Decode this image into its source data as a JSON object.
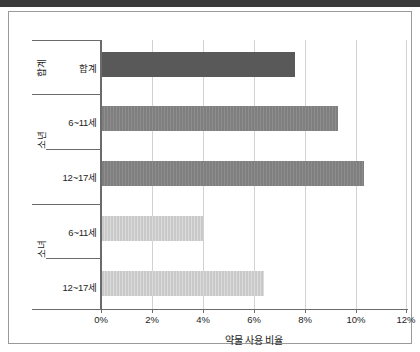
{
  "chart_data": {
    "type": "bar",
    "orientation": "horizontal",
    "title": "",
    "xlabel": "약물 사용 비율",
    "ylabel": "",
    "xlim": [
      0,
      12
    ],
    "xticks": [
      "0%",
      "2%",
      "4%",
      "6%",
      "8%",
      "10%",
      "12%"
    ],
    "xtick_values": [
      0,
      2,
      4,
      6,
      8,
      10,
      12
    ],
    "grid": true,
    "legend": "none",
    "groups": [
      {
        "name": "합계",
        "color": "#595959",
        "categories": [
          "합계"
        ],
        "values": [
          7.6
        ]
      },
      {
        "name": "소년",
        "color": "#7f7f7f",
        "categories": [
          "6~11세",
          "12~17세"
        ],
        "values": [
          9.3,
          10.3
        ]
      },
      {
        "name": "소녀",
        "color": "#c9c9c9",
        "categories": [
          "6~11세",
          "12~17세"
        ],
        "values": [
          4.0,
          6.4
        ]
      }
    ],
    "bars": [
      {
        "group": "합계",
        "category": "합계",
        "value": 7.6,
        "color": "#595959"
      },
      {
        "group": "소년",
        "category": "6~11세",
        "value": 9.3,
        "color": "#7f7f7f"
      },
      {
        "group": "소년",
        "category": "12~17세",
        "value": 10.3,
        "color": "#7f7f7f"
      },
      {
        "group": "소녀",
        "category": "6~11세",
        "value": 4.0,
        "color": "#c9c9c9"
      },
      {
        "group": "소녀",
        "category": "12~17세",
        "value": 6.4,
        "color": "#c9c9c9"
      }
    ]
  },
  "labels": {
    "group_total": "합계",
    "group_boys": "소년",
    "group_girls": "소녀",
    "cat_total": "합계",
    "cat_boys_young": "6~11세",
    "cat_boys_old": "12~17세",
    "cat_girls_young": "6~11세",
    "cat_girls_old": "12~17세",
    "xaxis_title": "약물 사용 비율",
    "tick_0": "0%",
    "tick_2": "2%",
    "tick_4": "4%",
    "tick_6": "6%",
    "tick_8": "8%",
    "tick_10": "10%",
    "tick_12": "12%"
  }
}
